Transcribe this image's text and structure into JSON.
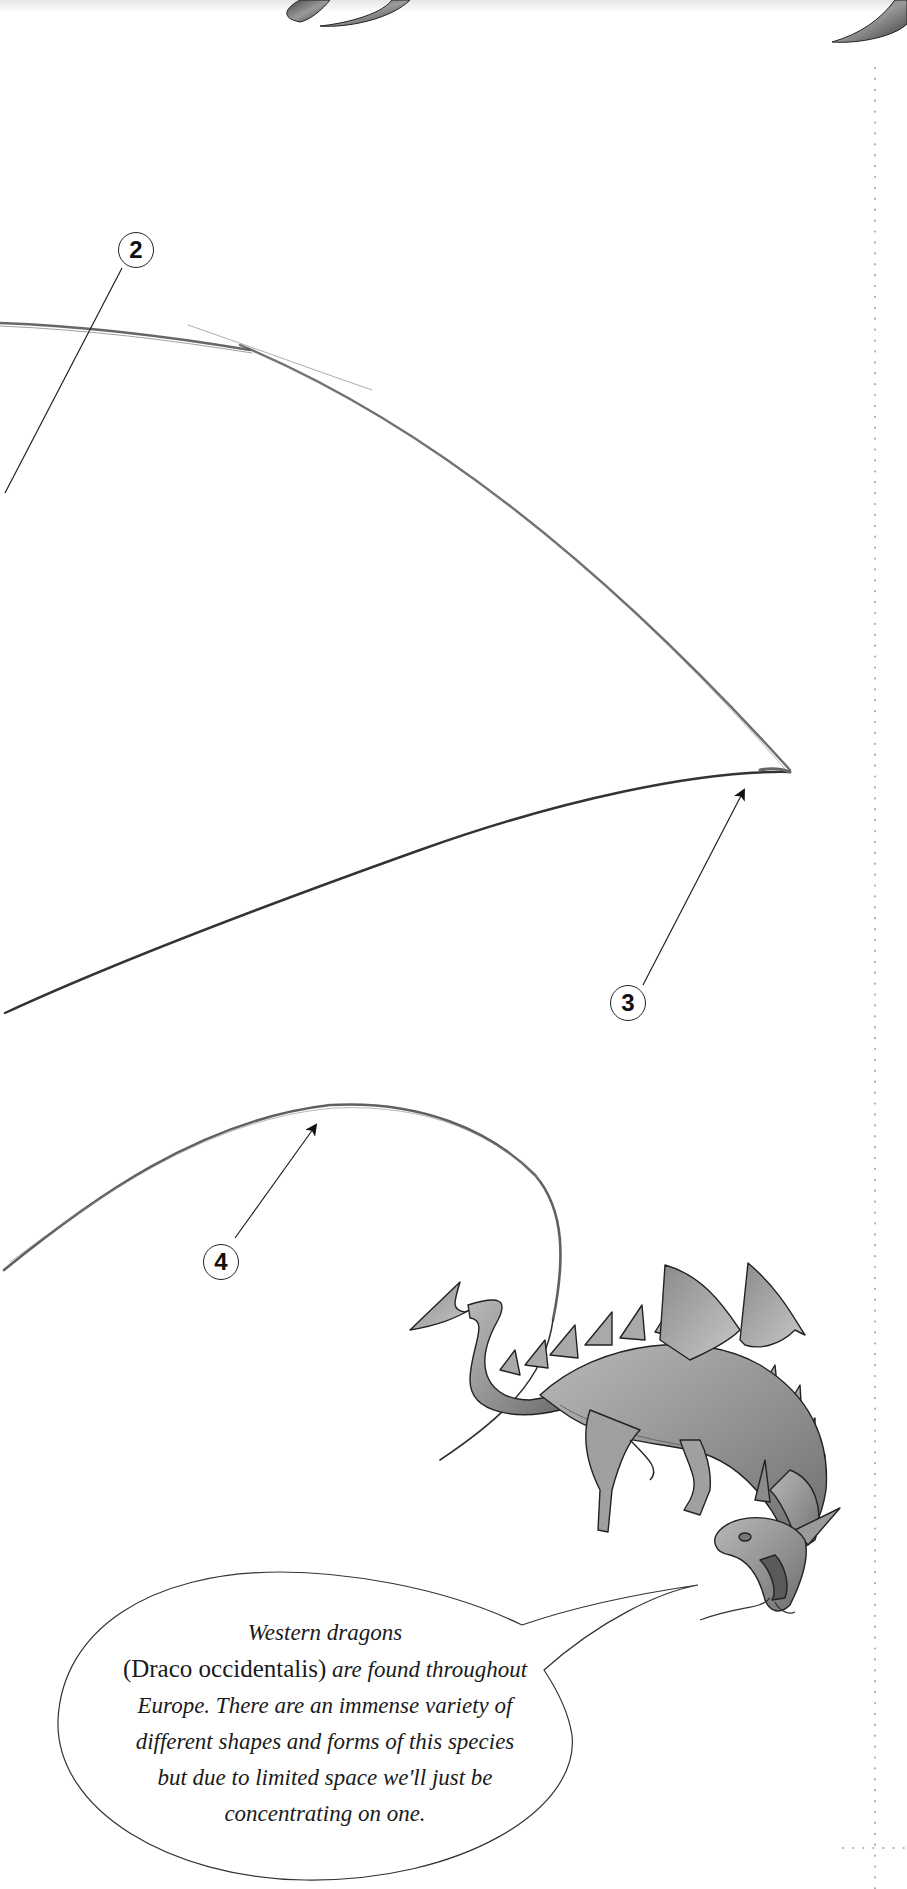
{
  "header": {
    "decoration": "ornamental-title-flourish"
  },
  "steps": [
    {
      "number": "2",
      "label": "2"
    },
    {
      "number": "3",
      "label": "3"
    },
    {
      "number": "4",
      "label": "4"
    }
  ],
  "illustration": {
    "subject": "western-dragon-flying"
  },
  "speech_bubble": {
    "line1": "Western dragons",
    "species_name": "(Draco occidentalis)",
    "line2_rest": " are found throughout",
    "line3": "Europe. There are an immense variety of",
    "line4": "different shapes and forms of this species",
    "line5": "but due to limited space we'll just be",
    "line6": "concentrating on one."
  },
  "colors": {
    "ink": "#222222",
    "pencil": "#555555",
    "dotted_guide": "#b0b0b0",
    "dragon_fill": "#9a9a9a"
  }
}
